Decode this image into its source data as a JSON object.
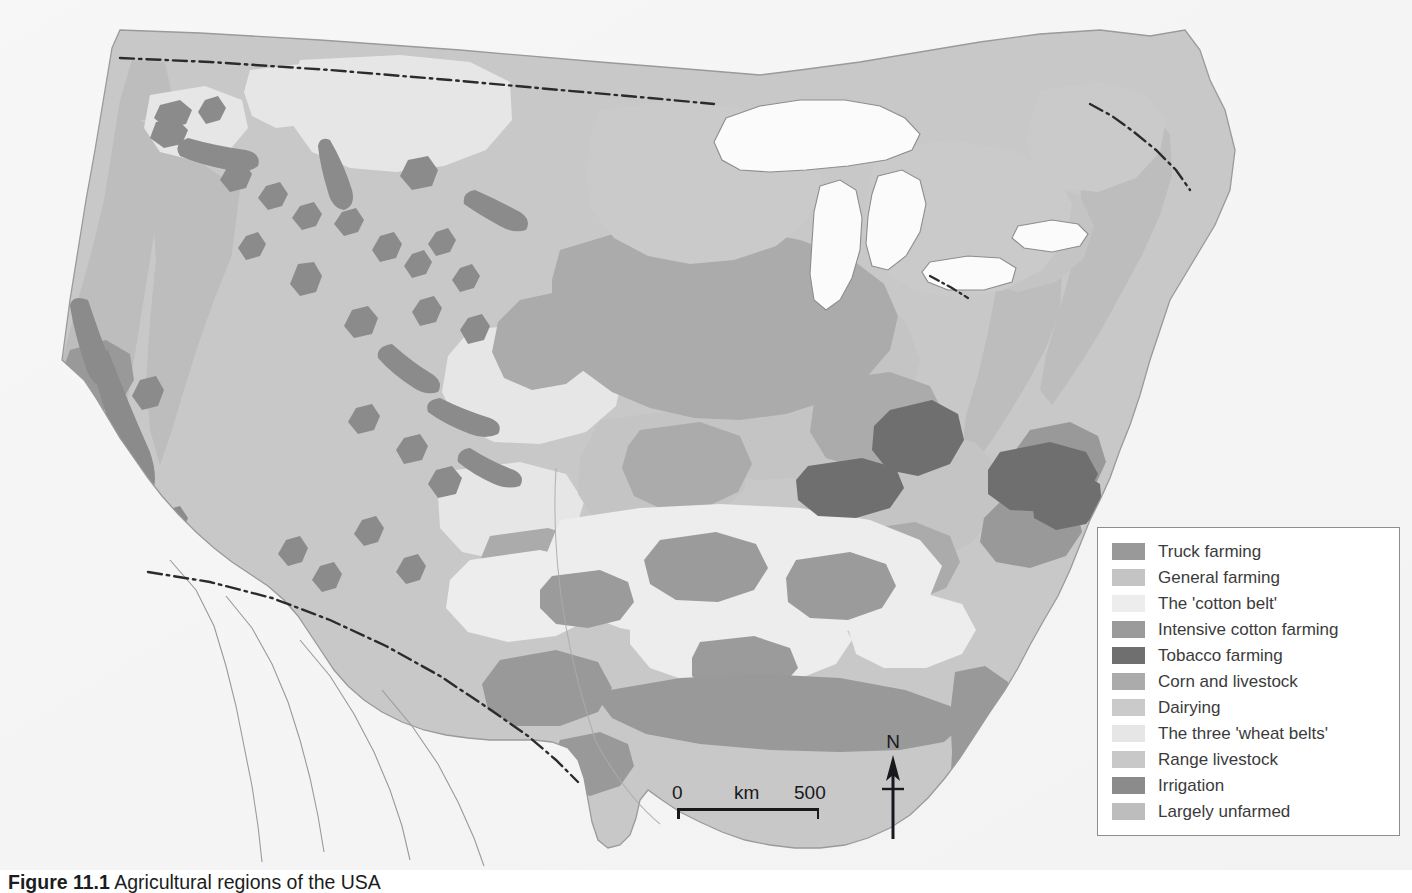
{
  "figure": {
    "caption_prefix": "Figure 11.1",
    "caption_text": "Agricultural regions of the USA",
    "title": "Agricultural regions of the USA"
  },
  "legend": {
    "title": "",
    "items": [
      {
        "label": "Truck farming",
        "color": "#999999"
      },
      {
        "label": "General farming",
        "color": "#c4c4c4"
      },
      {
        "label": "The 'cotton belt'",
        "color": "#ededed"
      },
      {
        "label": "Intensive cotton farming",
        "color": "#9b9b9b"
      },
      {
        "label": "Tobacco farming",
        "color": "#6f6f6f"
      },
      {
        "label": "Corn and livestock",
        "color": "#ababab"
      },
      {
        "label": "Dairying",
        "color": "#cacaca"
      },
      {
        "label": "The three 'wheat belts'",
        "color": "#e6e6e6"
      },
      {
        "label": "Range livestock",
        "color": "#c8c8c8"
      },
      {
        "label": "Irrigation",
        "color": "#8b8b8b"
      },
      {
        "label": "Largely unfarmed",
        "color": "#bdbdbd"
      }
    ]
  },
  "scalebar": {
    "min_label": "0",
    "unit_label": "km",
    "max_label": "500",
    "min_value": 0,
    "max_value": 500,
    "units": "km"
  },
  "compass": {
    "north_label": "N"
  },
  "map": {
    "background_color": "#f1f1f1",
    "ocean_color": "#ffffff",
    "outline_color": "#8d8d8d",
    "border_color": "#2a2a2a",
    "border_style": "dash-dot",
    "country": "United States of America",
    "features": [
      "Canada border (dash-dot)",
      "Mexico border (dash-dot)",
      "Great Lakes",
      "Gulf of Mexico coast",
      "Atlantic coast",
      "Pacific coast"
    ]
  }
}
